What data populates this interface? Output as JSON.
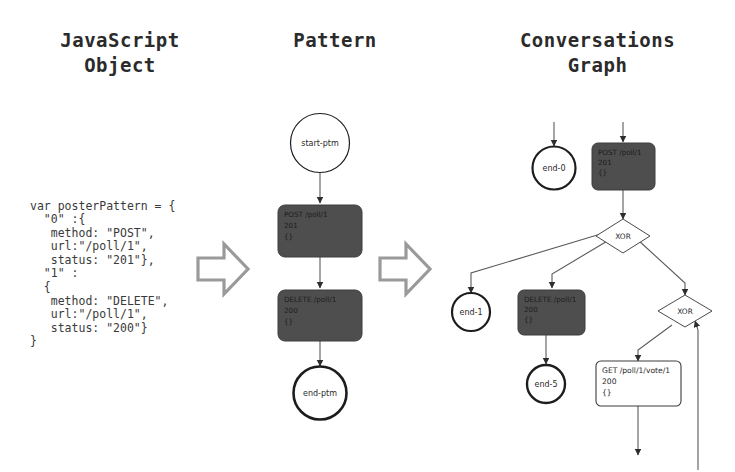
{
  "headings": {
    "javascript_object": "JavaScript\nObject",
    "pattern": "Pattern",
    "conversations_graph": "Conversations\nGraph"
  },
  "code": {
    "text": "var posterPattern = {\n  \"0\" :{\n   method: \"POST\",\n   url:\"/poll/1\",\n   status: \"201\"},\n  \"1\" :\n  {\n   method: \"DELETE\",\n   url:\"/poll/1\",\n   status: \"200\"}\n}"
  },
  "pattern_graph": {
    "start_node": {
      "label": "start-ptm"
    },
    "steps": [
      {
        "method": "POST /poll/1",
        "status": "201",
        "body": "{}"
      },
      {
        "method": "DELETE /poll/1",
        "status": "200",
        "body": "{}"
      }
    ],
    "end_node": {
      "label": "end-ptm"
    }
  },
  "conversations_graph": {
    "end_0": {
      "label": "end-0"
    },
    "end_1": {
      "label": "end-1"
    },
    "end_5": {
      "label": "end-5"
    },
    "post_node": {
      "method": "POST /poll/1",
      "status": "201",
      "body": "{}"
    },
    "delete_node": {
      "method": "DELETE /poll/1",
      "status": "200",
      "body": "{}"
    },
    "get_node": {
      "method": "GET /poll/1/vote/1",
      "status": "200",
      "body": "{}"
    },
    "xor_1": {
      "label": "XOR"
    },
    "xor_2": {
      "label": "XOR"
    }
  },
  "colors": {
    "background": "#ffffff",
    "heading_text": "#2b2b2b",
    "code_text": "#3a3a3a",
    "dark_node_fill": "#4e4e4e",
    "light_node_fill": "#ffffff",
    "edge_stroke": "#5a5a5a",
    "arrow_glyph": "#8f8f8f"
  }
}
